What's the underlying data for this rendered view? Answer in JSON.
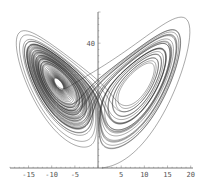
{
  "chart_data": {
    "type": "line",
    "title": "",
    "subtitle": "",
    "xlabel": "",
    "ylabel": "",
    "system": "lorenz",
    "parameters": {
      "sigma": 10,
      "rho": 28,
      "beta": 2.6667
    },
    "initial_state": {
      "x": 1,
      "y": 0,
      "z": 0
    },
    "duration": 60,
    "xlim": [
      -19,
      20.5
    ],
    "ylim": [
      0,
      50
    ],
    "x_ticks": [
      -15,
      -10,
      -5,
      5,
      10,
      15,
      20
    ],
    "x_tick_labels": [
      "-15",
      "-10",
      "-5",
      "5",
      "10",
      "15",
      "20"
    ],
    "y_ticks": [
      40
    ],
    "y_tick_labels": [
      "40"
    ],
    "grid": false,
    "legend": "none",
    "series": [
      {
        "name": "trajectory",
        "color": "#1e1e1e"
      }
    ]
  }
}
